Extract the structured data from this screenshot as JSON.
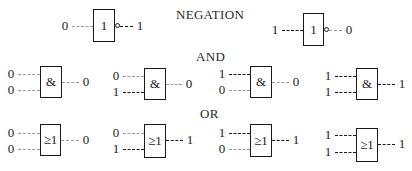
{
  "sections": {
    "negation": {
      "title": "NEGATION"
    },
    "and": {
      "title": "AND"
    },
    "or": {
      "title": "OR"
    }
  },
  "gates": {
    "not": [
      {
        "symbol": "1",
        "input": "0",
        "output": "1"
      },
      {
        "symbol": "1",
        "input": "1",
        "output": "0"
      }
    ],
    "and": [
      {
        "symbol": "&",
        "in_a": "0",
        "in_b": "0",
        "output": "0"
      },
      {
        "symbol": "&",
        "in_a": "0",
        "in_b": "1",
        "output": "0"
      },
      {
        "symbol": "&",
        "in_a": "1",
        "in_b": "0",
        "output": "0"
      },
      {
        "symbol": "&",
        "in_a": "1",
        "in_b": "1",
        "output": "1"
      }
    ],
    "or": [
      {
        "symbol": "≥1",
        "in_a": "0",
        "in_b": "0",
        "output": "0"
      },
      {
        "symbol": "≥1",
        "in_a": "0",
        "in_b": "1",
        "output": "1"
      },
      {
        "symbol": "≥1",
        "in_a": "1",
        "in_b": "0",
        "output": "1"
      },
      {
        "symbol": "≥1",
        "in_a": "1",
        "in_b": "1",
        "output": "1"
      }
    ]
  },
  "colors": {
    "high_line": "#1a1a1a",
    "low_line": "#9a9a9a"
  }
}
